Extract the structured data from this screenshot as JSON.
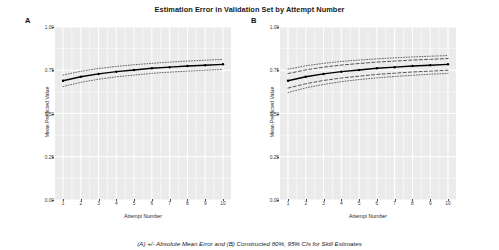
{
  "figure": {
    "title": "Estimation Error in Validation Set by Attempt Number",
    "caption": "(A) +/- Absolute Mean Error and (B) Constructed 80%, 95% CIs for Skill Estimates",
    "panel_a_tag": "A",
    "panel_b_tag": "B"
  },
  "chart_data": [
    {
      "type": "line",
      "panel": "A",
      "title": "",
      "xlabel": "Attempt Number",
      "ylabel": "Mean Predicted Value",
      "xlim": [
        0.55,
        10.45
      ],
      "ylim": [
        0.0,
        1.0
      ],
      "xticks": [
        1,
        2,
        3,
        4,
        5,
        6,
        7,
        8,
        9,
        10
      ],
      "xticklabels": [
        "1",
        "2",
        "3",
        "4",
        "5",
        "6",
        "7",
        "8",
        "9",
        "10"
      ],
      "yticks": [
        0.0,
        0.25,
        0.5,
        0.75,
        1.0
      ],
      "yticklabels": [
        "0.00",
        "0.25",
        "0.50",
        "0.75",
        "1.00"
      ],
      "grid": true,
      "grid_color": "#ffffff",
      "panel_background": "#ebebeb",
      "legend": "none",
      "x": [
        1,
        2,
        3,
        4,
        5,
        6,
        7,
        8,
        9,
        10
      ],
      "series": [
        {
          "name": "Mean Predicted Value",
          "style": "solid",
          "color": "#000000",
          "width": 1.6,
          "points": true,
          "values": [
            0.689,
            0.712,
            0.729,
            0.742,
            0.752,
            0.761,
            0.768,
            0.774,
            0.779,
            0.784
          ]
        },
        {
          "name": "Mean Predicted Value + Absolute Mean Error",
          "style": "dotted",
          "color": "#2b2b2b",
          "width": 0.8,
          "points": false,
          "values": [
            0.722,
            0.744,
            0.76,
            0.772,
            0.782,
            0.79,
            0.797,
            0.803,
            0.808,
            0.813
          ]
        },
        {
          "name": "Mean Predicted Value - Absolute Mean Error",
          "style": "dotted",
          "color": "#2b2b2b",
          "width": 0.8,
          "points": false,
          "values": [
            0.656,
            0.68,
            0.698,
            0.712,
            0.722,
            0.732,
            0.739,
            0.745,
            0.75,
            0.755
          ]
        }
      ]
    },
    {
      "type": "line",
      "panel": "B",
      "title": "",
      "xlabel": "Attempt Number",
      "ylabel": "Mean Predicted Value",
      "xlim": [
        0.55,
        10.45
      ],
      "ylim": [
        0.0,
        1.0
      ],
      "xticks": [
        1,
        2,
        3,
        4,
        5,
        6,
        7,
        8,
        9,
        10
      ],
      "xticklabels": [
        "1",
        "2",
        "3",
        "4",
        "5",
        "6",
        "7",
        "8",
        "9",
        "10"
      ],
      "yticks": [
        0.0,
        0.25,
        0.5,
        0.75,
        1.0
      ],
      "yticklabels": [
        "0.00",
        "0.25",
        "0.50",
        "0.75",
        "1.00"
      ],
      "grid": true,
      "grid_color": "#ffffff",
      "panel_background": "#ebebeb",
      "legend": "none",
      "x": [
        1,
        2,
        3,
        4,
        5,
        6,
        7,
        8,
        9,
        10
      ],
      "series": [
        {
          "name": "Mean Predicted Value",
          "style": "solid",
          "color": "#000000",
          "width": 1.6,
          "points": true,
          "values": [
            0.689,
            0.712,
            0.729,
            0.742,
            0.752,
            0.761,
            0.768,
            0.774,
            0.779,
            0.784
          ]
        },
        {
          "name": "95% CI upper",
          "style": "dotted",
          "color": "#2b2b2b",
          "width": 0.8,
          "points": false,
          "values": [
            0.756,
            0.776,
            0.79,
            0.801,
            0.809,
            0.816,
            0.822,
            0.827,
            0.831,
            0.835
          ]
        },
        {
          "name": "80% CI upper",
          "style": "dashed",
          "color": "#2b2b2b",
          "width": 0.9,
          "points": false,
          "values": [
            0.731,
            0.752,
            0.768,
            0.78,
            0.789,
            0.797,
            0.803,
            0.809,
            0.813,
            0.818
          ]
        },
        {
          "name": "80% CI lower",
          "style": "dashed",
          "color": "#2b2b2b",
          "width": 0.9,
          "points": false,
          "values": [
            0.647,
            0.672,
            0.691,
            0.705,
            0.716,
            0.726,
            0.733,
            0.74,
            0.745,
            0.75
          ]
        },
        {
          "name": "95% CI lower",
          "style": "dotted",
          "color": "#2b2b2b",
          "width": 0.8,
          "points": false,
          "values": [
            0.621,
            0.648,
            0.668,
            0.684,
            0.696,
            0.706,
            0.714,
            0.721,
            0.727,
            0.732
          ]
        }
      ]
    }
  ]
}
